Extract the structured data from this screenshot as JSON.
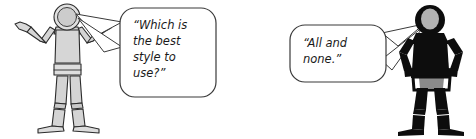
{
  "scene": {
    "title": "Two mannequin figures in dialogue",
    "background_color": "#ffffff",
    "width": 476,
    "height": 139
  },
  "colors": {
    "outline": "#2b2b2b",
    "mannequin_fill_light": "#d4d4d4",
    "mannequin_fill_mid": "#c2c2c2",
    "mannequin_fill_pale": "#e2e2e2",
    "silhouette_fill": "#0d0d0d",
    "head_gray": "#b3b3b3",
    "bubble_fill": "#ffffff",
    "bubble_stroke": "#3a3a3a",
    "text_color": "#1a1a1a"
  },
  "figures": [
    {
      "id": "left-figure",
      "name": "shrugging-mannequin",
      "style": "outlined light gray artist mannequin",
      "pose": "shrugging with both arms raised and palms open",
      "head_fill": "#d0d0d0",
      "body_fill": "#d4d4d4"
    },
    {
      "id": "right-figure",
      "name": "hands-on-hips-mannequin",
      "style": "black silhouette artist mannequin",
      "pose": "standing with hands on hips",
      "head_fill": "#b3b3b3",
      "body_fill": "#0d0d0d"
    }
  ],
  "speech_bubbles": [
    {
      "id": "left-bubble",
      "speaker": "left-figure",
      "tail_direction": "left",
      "lines": [
        "“Which is",
        "the best",
        "style to",
        "use?”"
      ],
      "full_text": "“Which is the best style to use?”"
    },
    {
      "id": "right-bubble",
      "speaker": "right-figure",
      "tail_direction": "right",
      "lines": [
        "“All and",
        "none.”"
      ],
      "full_text": "“All and none.”"
    }
  ]
}
